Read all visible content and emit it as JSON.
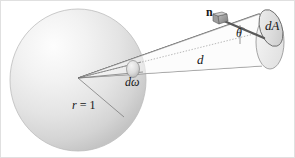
{
  "figure": {
    "background_color": "#ffffff",
    "width": 295,
    "height": 158
  },
  "labels": {
    "normal_vector": "n",
    "area_element": "dA",
    "angle": "θ",
    "distance": "d",
    "solid_angle": "dω",
    "radius_prefix": "r",
    "radius_equals": " = ",
    "radius_value": "1",
    "radius_full": "r = 1"
  },
  "geometry": {
    "sphere": {
      "center_x": 78,
      "center_y": 80,
      "radius_x": 68,
      "radius_y": 71,
      "fill_light": "#fbfbfb",
      "fill_mid": "#e3e3e3",
      "fill_dark": "#c9c9c9",
      "outline_color": "#b9b9b9"
    },
    "apex": {
      "x": 78,
      "y": 78
    },
    "solid_angle_patch": {
      "cx": 133,
      "cy": 69,
      "rx": 7,
      "ry": 9,
      "fill": "#d2d2d2",
      "outline": "#8a8a8a"
    },
    "cone_end_ellipse": {
      "cx": 270,
      "cy": 42,
      "rx": 14,
      "ry": 28,
      "fill": "#eeeeee",
      "outline": "#8f8f8f"
    },
    "dA_ellipse": {
      "cx": 271,
      "cy": 28,
      "rx": 11,
      "ry": 19,
      "fill": "#dcdcdc",
      "outline": "#6e6e6e",
      "rotation_deg": -18
    },
    "normal_arrow": {
      "tail_x": 262,
      "tail_y": 37,
      "head_x": 222,
      "head_y": 20,
      "color": "#5a5a5a"
    },
    "radius_line": {
      "x1": 78,
      "y1": 78,
      "x2": 124,
      "y2": 117,
      "color": "#7d7d7d"
    },
    "line_color": "#6d6d6d",
    "dotted_color": "#9a9a9a",
    "border_color": "#d8d8d8"
  }
}
